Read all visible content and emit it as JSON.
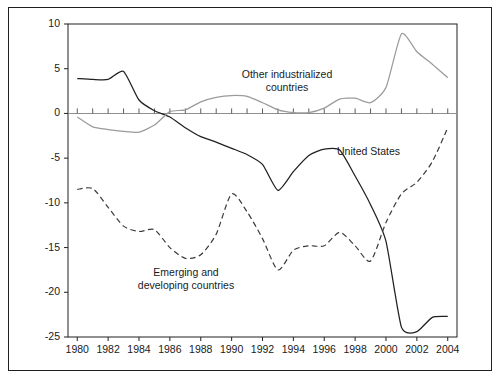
{
  "chart_data": {
    "type": "line",
    "title": "",
    "subtitle": "",
    "xlabel": "",
    "ylabel": "",
    "xlim": [
      1979.4,
      2004.6
    ],
    "ylim": [
      -25,
      10
    ],
    "grid": false,
    "legend_position": "inline-annotations",
    "y_ticks": [
      10,
      5,
      0,
      -5,
      -10,
      -15,
      -20,
      -25
    ],
    "y_tick_labels": [
      "10",
      "5",
      "0",
      "-5",
      "-10",
      "-15",
      "-20",
      "-25"
    ],
    "x_ticks": [
      1980,
      1982,
      1984,
      1986,
      1988,
      1990,
      1992,
      1994,
      1996,
      1998,
      2000,
      2002,
      2004
    ],
    "x_tick_labels": [
      "1980",
      "1982",
      "1984",
      "1986",
      "1988",
      "1990",
      "1992",
      "1994",
      "1996",
      "1998",
      "2000",
      "2002",
      "2004"
    ],
    "x_minor_ticks": [
      1981,
      1983,
      1985,
      1987,
      1989,
      1991,
      1993,
      1995,
      1997,
      1999,
      2001,
      2003
    ],
    "zero_line": 0,
    "x": [
      1980,
      1981,
      1982,
      1983,
      1984,
      1985,
      1986,
      1987,
      1988,
      1989,
      1990,
      1991,
      1992,
      1993,
      1994,
      1995,
      1996,
      1997,
      1998,
      1999,
      2000,
      2001,
      2002,
      2003,
      2004
    ],
    "series": [
      {
        "name": "United States",
        "style": "solid",
        "color": "#231f20",
        "values": [
          3.9,
          3.8,
          3.8,
          4.7,
          1.5,
          0.3,
          -0.4,
          -1.6,
          -2.6,
          -3.2,
          -3.9,
          -4.6,
          -5.7,
          -8.6,
          -6.5,
          -4.7,
          -4.0,
          -4.1,
          -7.0,
          -10.2,
          -14.3,
          -23.9,
          -24.4,
          -22.8,
          -22.7
        ]
      },
      {
        "name": "Other industrialized countries",
        "style": "solid",
        "color": "#9b9b9b",
        "values": [
          -0.4,
          -1.5,
          -1.8,
          -2.0,
          -2.1,
          -1.3,
          0.2,
          0.4,
          1.3,
          1.8,
          2.0,
          1.9,
          1.2,
          0.4,
          0.1,
          0.1,
          0.6,
          1.6,
          1.7,
          1.2,
          2.9,
          8.9,
          6.9,
          5.5,
          4.0
        ]
      },
      {
        "name": "Emerging and developing countries",
        "style": "dashed",
        "color": "#3a3a3a",
        "values": [
          -8.5,
          -8.4,
          -10.5,
          -12.6,
          -13.2,
          -13.0,
          -15.0,
          -16.2,
          -15.8,
          -13.5,
          -9.0,
          -11.0,
          -14.0,
          -17.5,
          -15.3,
          -14.8,
          -14.8,
          -13.3,
          -14.8,
          -16.5,
          -12.2,
          -9.0,
          -7.7,
          -5.4,
          -1.6
        ]
      }
    ],
    "annotations": [
      {
        "name": "other-industrialized-label",
        "line1": "Other industrialized",
        "line2": "countries",
        "x_px": 287,
        "y_px": 68,
        "align": "center"
      },
      {
        "name": "united-states-label",
        "line1": "United States",
        "line2": "",
        "x_px": 337,
        "y_px": 145,
        "align": "left"
      },
      {
        "name": "emerging-developing-label",
        "line1": "Emerging and",
        "line2": "developing countries",
        "x_px": 186,
        "y_px": 266,
        "align": "center"
      }
    ]
  }
}
